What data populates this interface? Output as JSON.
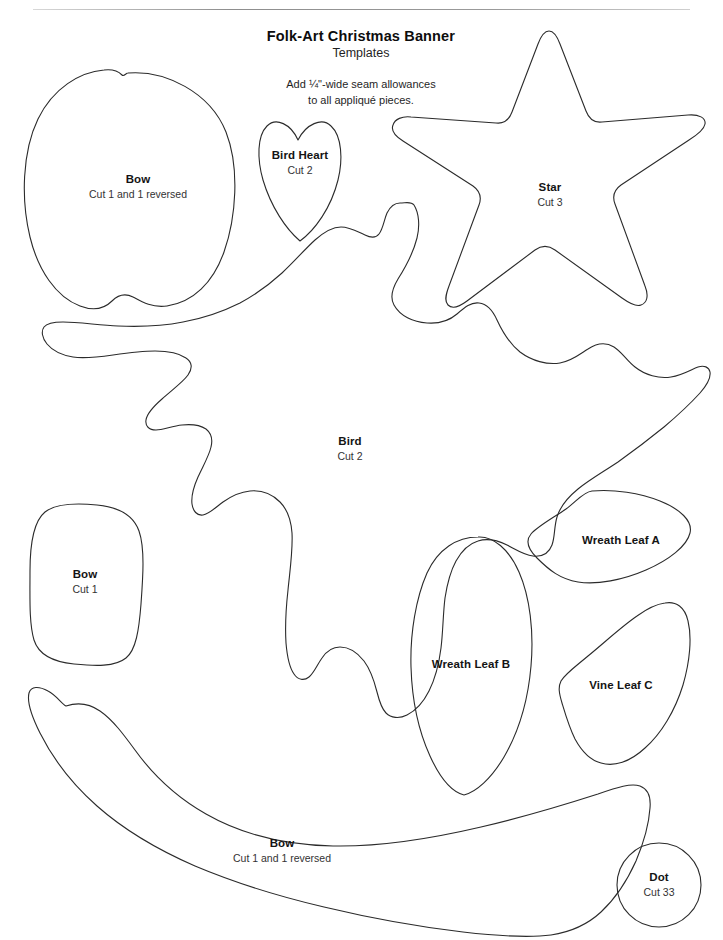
{
  "document": {
    "title": "Folk-Art Christmas Banner",
    "subtitle": "Templates",
    "note_line_1": "Add ¼\"-wide seam allowances",
    "note_line_2": "to all appliqué pieces.",
    "ink_color": "#1a1a1a",
    "outline_color": "#2b2b2b",
    "paper_color": "#ffffff"
  },
  "templates": [
    {
      "id": "bow-top-left",
      "name": "Bow",
      "cut": "Cut 1 and 1 reversed",
      "shape": "rounded-heart-apple"
    },
    {
      "id": "bird-heart",
      "name": "Bird Heart",
      "cut": "Cut 2",
      "shape": "elongated-heart"
    },
    {
      "id": "star",
      "name": "Star",
      "cut": "Cut 3",
      "shape": "five-point-star"
    },
    {
      "id": "bird",
      "name": "Bird",
      "cut": "Cut 2",
      "shape": "spread-wing-bird"
    },
    {
      "id": "bow-middle-left",
      "name": "Bow",
      "cut": "Cut 1",
      "shape": "rounded-rectangle"
    },
    {
      "id": "wreath-leaf-a",
      "name": "Wreath Leaf A",
      "cut": "",
      "shape": "leaf-pointed-oval"
    },
    {
      "id": "wreath-leaf-b",
      "name": "Wreath Leaf B",
      "cut": "",
      "shape": "leaf-tall-pointed-oval"
    },
    {
      "id": "vine-leaf-c",
      "name": "Vine Leaf C",
      "cut": "",
      "shape": "leaf-curved"
    },
    {
      "id": "bow-bottom",
      "name": "Bow",
      "cut": "Cut 1 and 1 reversed",
      "shape": "wide-crescent"
    },
    {
      "id": "dot",
      "name": "Dot",
      "cut": "Cut 33",
      "shape": "circle"
    }
  ]
}
